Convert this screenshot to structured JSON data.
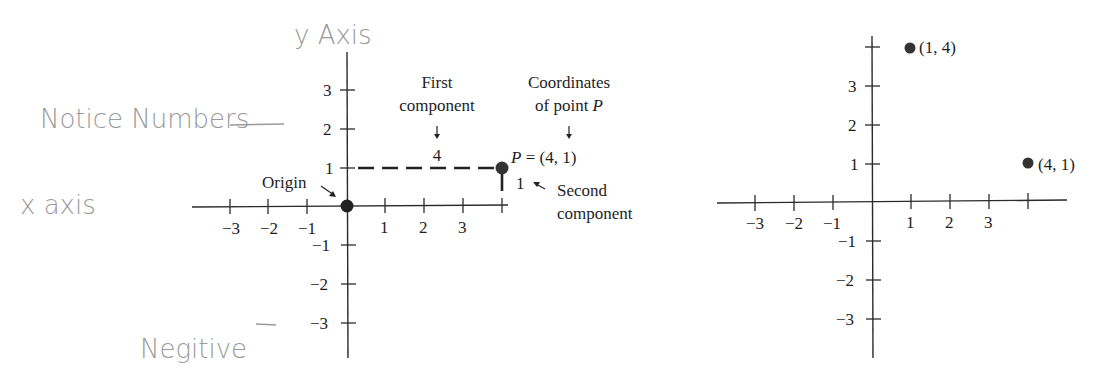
{
  "handwritten": {
    "y_axis": "y Axis",
    "notice": "Notice Numbers",
    "x_axis": "x axis",
    "negative": "Negitive"
  },
  "left_graph": {
    "x_ticks": [
      "−3",
      "−2",
      "−1",
      "1",
      "2",
      "3"
    ],
    "y_ticks": [
      "3",
      "2",
      "1",
      "−1",
      "−2",
      "−3"
    ],
    "origin_label": "Origin",
    "first_component_line1": "First",
    "first_component_line2": "component",
    "first_component_value": "4",
    "coords_line1": "Coordinates",
    "coords_line2": "of point P",
    "point_label": "P = (4, 1)",
    "second_component_value": "1",
    "second_component_line1": "Second",
    "second_component_line2": "component"
  },
  "right_graph": {
    "x_ticks": [
      "−3",
      "−2",
      "−1",
      "1",
      "2",
      "3"
    ],
    "y_ticks": [
      "3",
      "2",
      "1",
      "−1",
      "−2",
      "−3"
    ],
    "point_a_label": "(1, 4)",
    "point_b_label": "(4, 1)"
  },
  "colors": {
    "ink": "#1e1e1e",
    "pencil": "#9a9a9a",
    "point": "#333333"
  }
}
